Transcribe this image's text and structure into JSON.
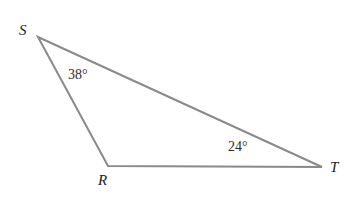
{
  "figure": {
    "kind": "geometry-triangle-diagram",
    "background_color": "#ffffff",
    "stroke_color": "#8a8a8a",
    "stroke_width": 2,
    "label_color": "#222222",
    "width": 353,
    "height": 216
  },
  "triangle": {
    "name": "RST",
    "vertices": [
      {
        "id": "S",
        "label": "S",
        "x": 38,
        "y": 37
      },
      {
        "id": "R",
        "label": "R",
        "x": 108,
        "y": 166
      },
      {
        "id": "T",
        "label": "T",
        "x": 322,
        "y": 167
      }
    ],
    "edges": [
      {
        "id": "SR",
        "from": "S",
        "to": "R"
      },
      {
        "id": "RT",
        "from": "R",
        "to": "T"
      },
      {
        "id": "ST",
        "from": "S",
        "to": "T"
      }
    ],
    "path_points": "38,37 108,166 322,167"
  },
  "angles": [
    {
      "id": "angle-S",
      "at_vertex": "S",
      "value": 38,
      "unit": "degrees",
      "label": "38°"
    },
    {
      "id": "angle-T",
      "at_vertex": "T",
      "value": 24,
      "unit": "degrees",
      "label": "24°"
    }
  ],
  "labels": {
    "vertex_S": "S",
    "vertex_R": "R",
    "vertex_T": "T",
    "angle_S": "38°",
    "angle_T": "24°"
  }
}
